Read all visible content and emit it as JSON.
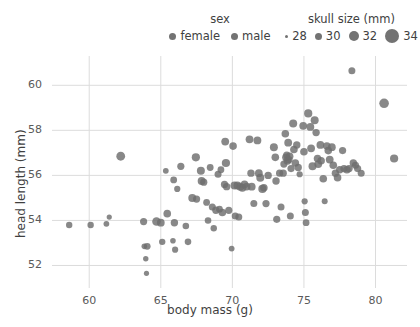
{
  "chart_data": {
    "type": "scatter",
    "title": "",
    "xlabel": "body mass (g)",
    "ylabel": "head length (mm)",
    "xlim": [
      57.4,
      82.2
    ],
    "ylim": [
      51.0,
      61.3
    ],
    "xticks": [
      60,
      65,
      70,
      75,
      80
    ],
    "yticks": [
      52,
      54,
      56,
      58,
      60
    ],
    "grid": true,
    "legend_position": "top",
    "legends": [
      {
        "title": "sex",
        "encoding": "color",
        "entries": [
          {
            "label": "female",
            "color": "#737373",
            "size": 7
          },
          {
            "label": "male",
            "color": "#737373",
            "size": 7
          }
        ]
      },
      {
        "title": "skull size (mm)",
        "encoding": "size",
        "entries": [
          {
            "label": "28",
            "color": "#737373",
            "size": 3
          },
          {
            "label": "30",
            "color": "#737373",
            "size": 7
          },
          {
            "label": "32",
            "color": "#737373",
            "size": 10
          },
          {
            "label": "34",
            "color": "#737373",
            "size": 14
          }
        ]
      }
    ],
    "marker": {
      "color": "#6e6e6e",
      "opacity": 0.82,
      "shape": "circle"
    },
    "points": [
      {
        "x": 58.6,
        "y": 53.8,
        "r": 3.2
      },
      {
        "x": 60.1,
        "y": 53.8,
        "r": 3.2
      },
      {
        "x": 61.2,
        "y": 53.85,
        "r": 2.9
      },
      {
        "x": 61.4,
        "y": 54.15,
        "r": 2.6
      },
      {
        "x": 62.2,
        "y": 56.85,
        "r": 4.4
      },
      {
        "x": 63.8,
        "y": 53.95,
        "r": 3.6
      },
      {
        "x": 63.85,
        "y": 52.85,
        "r": 2.8
      },
      {
        "x": 64.05,
        "y": 52.85,
        "r": 3.4
      },
      {
        "x": 63.95,
        "y": 52.3,
        "r": 2.7
      },
      {
        "x": 64.0,
        "y": 51.65,
        "r": 2.6
      },
      {
        "x": 64.7,
        "y": 53.95,
        "r": 4.3
      },
      {
        "x": 65.0,
        "y": 53.9,
        "r": 3.9
      },
      {
        "x": 65.1,
        "y": 53.05,
        "r": 3.2
      },
      {
        "x": 65.35,
        "y": 56.2,
        "r": 2.9
      },
      {
        "x": 65.45,
        "y": 54.3,
        "r": 3.8
      },
      {
        "x": 65.85,
        "y": 53.1,
        "r": 2.8
      },
      {
        "x": 65.9,
        "y": 55.8,
        "r": 3.4
      },
      {
        "x": 65.95,
        "y": 53.9,
        "r": 3.7
      },
      {
        "x": 66.0,
        "y": 52.7,
        "r": 3.1
      },
      {
        "x": 66.15,
        "y": 55.4,
        "r": 3.1
      },
      {
        "x": 66.4,
        "y": 56.4,
        "r": 3.6
      },
      {
        "x": 66.75,
        "y": 53.75,
        "r": 3.3
      },
      {
        "x": 66.9,
        "y": 53.05,
        "r": 3.3
      },
      {
        "x": 67.2,
        "y": 55.0,
        "r": 4.0
      },
      {
        "x": 67.45,
        "y": 56.8,
        "r": 4.1
      },
      {
        "x": 67.5,
        "y": 54.95,
        "r": 3.6
      },
      {
        "x": 67.8,
        "y": 56.2,
        "r": 4.0
      },
      {
        "x": 67.85,
        "y": 55.75,
        "r": 3.9
      },
      {
        "x": 68.0,
        "y": 55.7,
        "r": 3.6
      },
      {
        "x": 68.2,
        "y": 54.8,
        "r": 3.4
      },
      {
        "x": 68.3,
        "y": 54.0,
        "r": 3.3
      },
      {
        "x": 68.45,
        "y": 56.35,
        "r": 3.4
      },
      {
        "x": 68.6,
        "y": 54.6,
        "r": 3.5
      },
      {
        "x": 68.7,
        "y": 53.65,
        "r": 3.2
      },
      {
        "x": 68.85,
        "y": 54.45,
        "r": 3.7
      },
      {
        "x": 69.0,
        "y": 56.05,
        "r": 3.5
      },
      {
        "x": 69.1,
        "y": 54.5,
        "r": 3.4
      },
      {
        "x": 69.2,
        "y": 56.25,
        "r": 3.4
      },
      {
        "x": 69.3,
        "y": 54.35,
        "r": 3.8
      },
      {
        "x": 69.45,
        "y": 55.6,
        "r": 3.6
      },
      {
        "x": 69.5,
        "y": 57.5,
        "r": 3.9
      },
      {
        "x": 69.55,
        "y": 56.55,
        "r": 4.1
      },
      {
        "x": 69.6,
        "y": 55.5,
        "r": 3.7
      },
      {
        "x": 69.75,
        "y": 54.45,
        "r": 3.6
      },
      {
        "x": 69.95,
        "y": 52.75,
        "r": 2.9
      },
      {
        "x": 70.05,
        "y": 57.3,
        "r": 3.8
      },
      {
        "x": 70.15,
        "y": 55.55,
        "r": 4.0
      },
      {
        "x": 70.2,
        "y": 54.2,
        "r": 3.5
      },
      {
        "x": 70.35,
        "y": 55.55,
        "r": 3.9
      },
      {
        "x": 70.45,
        "y": 54.15,
        "r": 3.5
      },
      {
        "x": 70.55,
        "y": 55.5,
        "r": 3.9
      },
      {
        "x": 70.7,
        "y": 55.45,
        "r": 4.0
      },
      {
        "x": 70.85,
        "y": 55.6,
        "r": 3.8
      },
      {
        "x": 71.0,
        "y": 55.5,
        "r": 3.8
      },
      {
        "x": 71.2,
        "y": 57.6,
        "r": 3.9
      },
      {
        "x": 71.3,
        "y": 56.1,
        "r": 3.7
      },
      {
        "x": 71.35,
        "y": 55.5,
        "r": 3.9
      },
      {
        "x": 71.5,
        "y": 54.75,
        "r": 3.5
      },
      {
        "x": 71.75,
        "y": 57.55,
        "r": 3.9
      },
      {
        "x": 71.85,
        "y": 56.1,
        "r": 3.9
      },
      {
        "x": 71.95,
        "y": 55.9,
        "r": 4.0
      },
      {
        "x": 72.1,
        "y": 55.4,
        "r": 4.1
      },
      {
        "x": 72.2,
        "y": 55.45,
        "r": 3.8
      },
      {
        "x": 72.35,
        "y": 54.75,
        "r": 3.6
      },
      {
        "x": 72.5,
        "y": 56.0,
        "r": 3.7
      },
      {
        "x": 72.9,
        "y": 57.25,
        "r": 4.0
      },
      {
        "x": 73.0,
        "y": 56.8,
        "r": 3.8
      },
      {
        "x": 73.05,
        "y": 55.75,
        "r": 3.7
      },
      {
        "x": 73.1,
        "y": 54.05,
        "r": 3.6
      },
      {
        "x": 73.3,
        "y": 56.1,
        "r": 3.6
      },
      {
        "x": 73.4,
        "y": 54.6,
        "r": 3.5
      },
      {
        "x": 73.55,
        "y": 56.1,
        "r": 3.7
      },
      {
        "x": 73.6,
        "y": 56.5,
        "r": 3.6
      },
      {
        "x": 73.7,
        "y": 57.85,
        "r": 3.8
      },
      {
        "x": 73.75,
        "y": 56.8,
        "r": 3.9
      },
      {
        "x": 73.8,
        "y": 56.9,
        "r": 3.6
      },
      {
        "x": 73.85,
        "y": 56.65,
        "r": 3.9
      },
      {
        "x": 73.9,
        "y": 57.45,
        "r": 3.9
      },
      {
        "x": 73.95,
        "y": 56.7,
        "r": 3.7
      },
      {
        "x": 74.0,
        "y": 56.85,
        "r": 3.8
      },
      {
        "x": 74.05,
        "y": 54.2,
        "r": 3.5
      },
      {
        "x": 74.1,
        "y": 56.3,
        "r": 3.6
      },
      {
        "x": 74.25,
        "y": 58.3,
        "r": 4.0
      },
      {
        "x": 74.3,
        "y": 57.15,
        "r": 3.8
      },
      {
        "x": 74.4,
        "y": 56.55,
        "r": 3.8
      },
      {
        "x": 74.5,
        "y": 57.35,
        "r": 3.7
      },
      {
        "x": 74.6,
        "y": 56.35,
        "r": 3.7
      },
      {
        "x": 74.7,
        "y": 56.05,
        "r": 3.1
      },
      {
        "x": 74.95,
        "y": 58.2,
        "r": 3.9
      },
      {
        "x": 75.0,
        "y": 57.05,
        "r": 3.8
      },
      {
        "x": 75.05,
        "y": 54.85,
        "r": 3.1
      },
      {
        "x": 75.1,
        "y": 54.35,
        "r": 3.5
      },
      {
        "x": 75.15,
        "y": 53.9,
        "r": 3.4
      },
      {
        "x": 75.3,
        "y": 58.75,
        "r": 4.1
      },
      {
        "x": 75.45,
        "y": 58.15,
        "r": 3.9
      },
      {
        "x": 75.5,
        "y": 57.2,
        "r": 3.9
      },
      {
        "x": 75.6,
        "y": 56.4,
        "r": 4.0
      },
      {
        "x": 75.75,
        "y": 58.45,
        "r": 4.0
      },
      {
        "x": 75.85,
        "y": 57.9,
        "r": 3.7
      },
      {
        "x": 75.95,
        "y": 56.75,
        "r": 3.8
      },
      {
        "x": 76.0,
        "y": 56.5,
        "r": 3.9
      },
      {
        "x": 76.15,
        "y": 57.35,
        "r": 3.9
      },
      {
        "x": 76.2,
        "y": 56.65,
        "r": 3.8
      },
      {
        "x": 76.35,
        "y": 55.85,
        "r": 3.8
      },
      {
        "x": 76.45,
        "y": 54.85,
        "r": 3.0
      },
      {
        "x": 76.6,
        "y": 57.3,
        "r": 3.8
      },
      {
        "x": 76.7,
        "y": 57.1,
        "r": 3.8
      },
      {
        "x": 76.8,
        "y": 56.7,
        "r": 3.9
      },
      {
        "x": 76.95,
        "y": 57.25,
        "r": 3.9
      },
      {
        "x": 77.05,
        "y": 56.45,
        "r": 3.8
      },
      {
        "x": 77.2,
        "y": 56.1,
        "r": 3.7
      },
      {
        "x": 77.35,
        "y": 55.9,
        "r": 3.8
      },
      {
        "x": 77.5,
        "y": 56.25,
        "r": 3.7
      },
      {
        "x": 77.7,
        "y": 57.1,
        "r": 3.6
      },
      {
        "x": 77.8,
        "y": 56.3,
        "r": 3.7
      },
      {
        "x": 78.0,
        "y": 56.25,
        "r": 3.8
      },
      {
        "x": 78.15,
        "y": 56.3,
        "r": 3.7
      },
      {
        "x": 78.35,
        "y": 60.65,
        "r": 3.5
      },
      {
        "x": 78.45,
        "y": 56.55,
        "r": 3.7
      },
      {
        "x": 78.6,
        "y": 56.45,
        "r": 3.6
      },
      {
        "x": 78.75,
        "y": 56.3,
        "r": 3.6
      },
      {
        "x": 79.0,
        "y": 56.1,
        "r": 3.5
      },
      {
        "x": 80.6,
        "y": 59.2,
        "r": 4.8
      },
      {
        "x": 81.3,
        "y": 56.75,
        "r": 4.1
      }
    ]
  },
  "axes": {
    "x_tick_labels": [
      "60",
      "65",
      "70",
      "75",
      "80"
    ],
    "y_tick_labels": [
      "52",
      "54",
      "56",
      "58",
      "60"
    ],
    "x_title": "body mass (g)",
    "y_title": "head length (mm)"
  },
  "colors": {
    "marker": "#6e6e6e",
    "grid": "#dcdcdc",
    "text": "#4a4a4a"
  }
}
